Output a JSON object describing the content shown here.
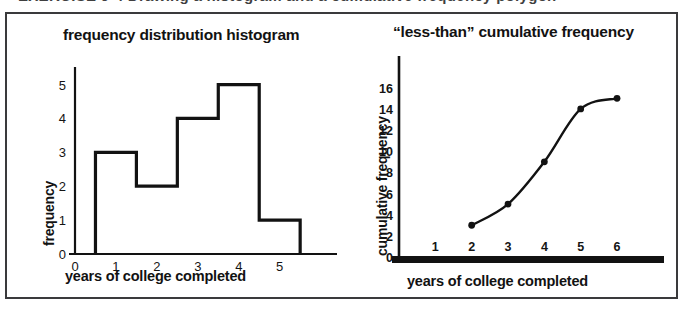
{
  "figure": {
    "top_cut_caption": "EXERCISE 9-4  Drawing a histogram and a cumulative frequency polygon"
  },
  "chart_data": [
    {
      "id": "histogram",
      "type": "bar",
      "title": "frequency distribution histogram",
      "xlabel": "years of college  completed",
      "ylabel": "frequency",
      "categories": [
        "1",
        "2",
        "3",
        "4",
        "5"
      ],
      "bin_edges": [
        0.5,
        1.5,
        2.5,
        3.5,
        4.5,
        5.5
      ],
      "values": [
        3,
        2,
        4,
        5,
        1
      ],
      "x_ticks": [
        "0",
        "1",
        "2",
        "3",
        "4",
        "5"
      ],
      "x_tick_values": [
        0,
        1,
        2,
        3,
        4,
        5
      ],
      "y_ticks": [
        "0",
        "1",
        "2",
        "3",
        "4",
        "5"
      ],
      "y_tick_values": [
        0,
        1,
        2,
        3,
        4,
        5
      ],
      "xlim": [
        0,
        6.4
      ],
      "ylim": [
        0,
        5.4
      ],
      "grid": false,
      "legend": "none"
    },
    {
      "id": "ogive",
      "type": "line",
      "title": "“less-than” cumulative frequency",
      "xlabel": "years of college completed",
      "ylabel": "cumulative frequency",
      "x": [
        2,
        3,
        4,
        5,
        6
      ],
      "values": [
        3,
        5,
        9,
        14,
        15
      ],
      "markers": true,
      "x_ticks": [
        "1",
        "2",
        "3",
        "4",
        "5",
        "6"
      ],
      "x_tick_values": [
        1,
        2,
        3,
        4,
        5,
        6
      ],
      "y_ticks": [
        "0",
        "2",
        "4",
        "6",
        "8",
        "10",
        "12",
        "14",
        "16"
      ],
      "y_tick_values": [
        0,
        2,
        4,
        6,
        8,
        10,
        12,
        14,
        16
      ],
      "xlim": [
        0,
        7.1
      ],
      "ylim": [
        0,
        19
      ],
      "grid": false,
      "legend": "none"
    }
  ],
  "colors": {
    "ink": "#121212",
    "frame": "#3a3a3c",
    "paper": "#ffffff"
  }
}
